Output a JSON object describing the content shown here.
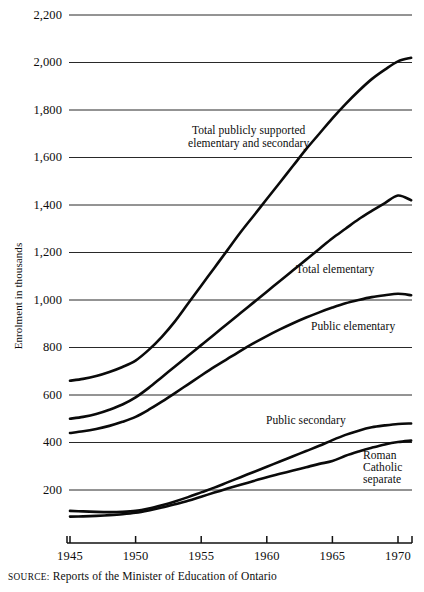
{
  "chart_data": {
    "type": "line",
    "title": "",
    "xlabel": "",
    "ylabel": "Enrolment in thousands",
    "xlim": [
      1945,
      1971
    ],
    "ylim": [
      0,
      2200
    ],
    "grid": true,
    "legend_position": "inline-annotations",
    "x_ticks": [
      1945,
      1950,
      1955,
      1960,
      1965,
      1970
    ],
    "x_tick_labels": [
      "1945",
      "1950",
      "1955",
      "1960",
      "1965",
      "1970"
    ],
    "y_ticks": [
      200,
      400,
      600,
      800,
      1000,
      1200,
      1400,
      1600,
      1800,
      2000,
      2200
    ],
    "y_tick_labels": [
      "200",
      "400",
      "600",
      "800",
      "1,000",
      "1,200",
      "1,400",
      "1,600",
      "1,800",
      "2,000",
      "2,200"
    ],
    "x": [
      1945,
      1946,
      1947,
      1948,
      1949,
      1950,
      1951,
      1952,
      1953,
      1954,
      1955,
      1956,
      1957,
      1958,
      1959,
      1960,
      1961,
      1962,
      1963,
      1964,
      1965,
      1966,
      1967,
      1968,
      1969,
      1970,
      1971
    ],
    "series": [
      {
        "name": "Total publicly supported elementary and secondary",
        "label": "Total publicly supported\nelementary and secondary",
        "values": [
          660,
          668,
          680,
          697,
          718,
          745,
          790,
          845,
          910,
          985,
          1060,
          1135,
          1210,
          1285,
          1355,
          1425,
          1495,
          1565,
          1635,
          1700,
          1765,
          1825,
          1880,
          1930,
          1970,
          2005,
          2020
        ]
      },
      {
        "name": "Total elementary",
        "label": "Total elementary",
        "values": [
          500,
          508,
          520,
          538,
          560,
          590,
          630,
          675,
          720,
          765,
          810,
          855,
          900,
          945,
          990,
          1035,
          1080,
          1125,
          1170,
          1215,
          1260,
          1300,
          1340,
          1375,
          1408,
          1440,
          1420
        ]
      },
      {
        "name": "Public elementary",
        "label": "Public elementary",
        "values": [
          440,
          447,
          457,
          470,
          487,
          508,
          538,
          572,
          608,
          645,
          682,
          718,
          752,
          786,
          818,
          848,
          876,
          902,
          926,
          948,
          968,
          986,
          1000,
          1012,
          1020,
          1026,
          1020
        ]
      },
      {
        "name": "Public secondary",
        "label": "Public secondary",
        "values": [
          112,
          110,
          108,
          107,
          108,
          112,
          122,
          136,
          152,
          170,
          190,
          210,
          232,
          254,
          276,
          298,
          320,
          342,
          364,
          386,
          410,
          432,
          450,
          464,
          472,
          478,
          480
        ]
      },
      {
        "name": "Roman Catholic separate",
        "label": "Roman\nCatholic\nseparate",
        "values": [
          88,
          89,
          91,
          94,
          98,
          104,
          114,
          126,
          140,
          155,
          172,
          189,
          206,
          222,
          238,
          254,
          268,
          282,
          296,
          310,
          322,
          344,
          362,
          378,
          392,
          402,
          408
        ]
      }
    ]
  },
  "axis": {
    "y_title": "Enrolment in thousands"
  },
  "source": {
    "key": "SOURCE:",
    "text": "Reports of the Minister of Education of Ontario"
  }
}
